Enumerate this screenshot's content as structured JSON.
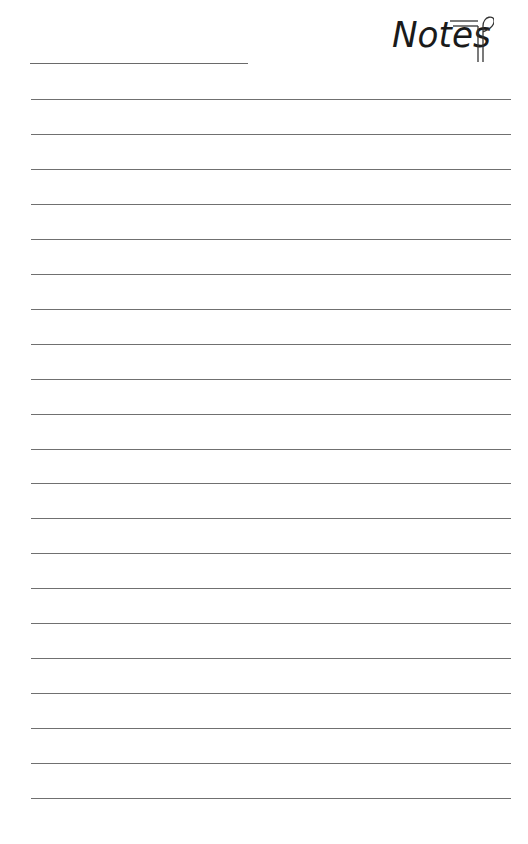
{
  "page": {
    "title": "Notes",
    "logo_icon": "paragraph-mark-icon",
    "name_line": {
      "label": ""
    },
    "ruled_lines": {
      "count": 21,
      "first_y": 99,
      "spacing": 34.95,
      "color": "#707070"
    }
  }
}
